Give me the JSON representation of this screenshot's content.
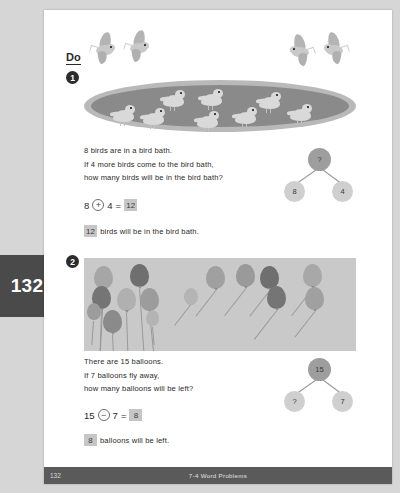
{
  "page": {
    "tab_number": "132",
    "footer_page": "132",
    "footer_title": "7-4  Word Problems",
    "section_heading": "Do"
  },
  "problems": [
    {
      "marker": "1",
      "lines": [
        "8 birds are in a bird bath.",
        "If 4 more birds come to the bird bath,",
        "how many birds will be in the bird bath?"
      ],
      "equation": {
        "left": "8",
        "operator": "+",
        "right": "4",
        "equals": "=",
        "answer": "12"
      },
      "sentence_answer": "12",
      "sentence_text": "birds will be in the bird bath.",
      "bond": {
        "top": "?",
        "left": "8",
        "right": "4"
      },
      "illustration": {
        "name": "bird-bath",
        "birds_in_bath": 8,
        "birds_flying_left": 2,
        "birds_flying_right": 2
      }
    },
    {
      "marker": "2",
      "lines": [
        "There are 15 balloons.",
        "If 7 balloons fly away,",
        "how many balloons will be left?"
      ],
      "equation": {
        "left": "15",
        "operator": "−",
        "right": "7",
        "equals": "=",
        "answer": "8"
      },
      "sentence_answer": "8",
      "sentence_text": "balloons will be left.",
      "bond": {
        "top": "15",
        "left": "?",
        "right": "7"
      },
      "illustration": {
        "name": "balloons",
        "balloons_held": 8,
        "balloons_flying_away": 7
      }
    }
  ],
  "colors": {
    "page_background": "#ffffff",
    "margin_background": "#d6d6d6",
    "tab_background": "#4a4a4a",
    "footer_background": "#5a5a5a",
    "bath_outer": "#b9b9b9",
    "bath_inner": "#8a8a8a",
    "balloon_scene": "#c9c9c9",
    "answer_box": "#c6c6c6",
    "bond_top_node": "#9e9e9e",
    "bond_child_node": "#cfcfcf"
  }
}
